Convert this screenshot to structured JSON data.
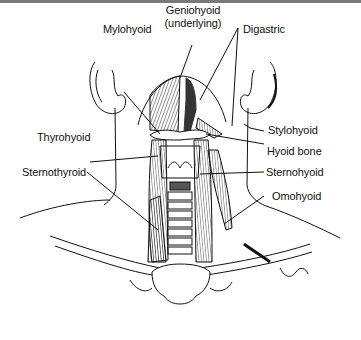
{
  "figure": {
    "labels": [
      {
        "id": "geniohyoid",
        "text": "Geniohyoid"
      },
      {
        "id": "geniohyoid_sub",
        "text": "(underlying)"
      },
      {
        "id": "mylohyoid",
        "text": "Mylohyoid"
      },
      {
        "id": "digastric",
        "text": "Digastric"
      },
      {
        "id": "stylohyoid",
        "text": "Stylohyoid"
      },
      {
        "id": "thyrohyoid",
        "text": "Thyrohyoid"
      },
      {
        "id": "hyoid_bone",
        "text": "Hyoid bone"
      },
      {
        "id": "sternohyoid",
        "text": "Sternohyoid"
      },
      {
        "id": "sternothyroid",
        "text": "Sternothyroid"
      },
      {
        "id": "omohyoid",
        "text": "Omohyoid"
      }
    ]
  }
}
